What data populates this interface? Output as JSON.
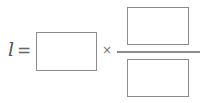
{
  "equation": {
    "variable": "l",
    "equals_sign": "=",
    "multiply_sign": "×",
    "inputs": {
      "factor": {
        "value": ""
      },
      "numerator": {
        "value": ""
      },
      "denominator": {
        "value": ""
      }
    }
  }
}
